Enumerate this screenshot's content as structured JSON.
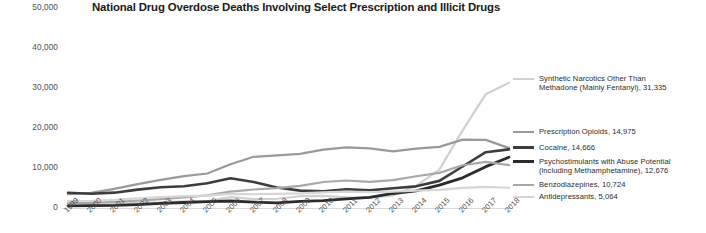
{
  "chart_data": {
    "type": "line",
    "title": "National Drug Overdose Deaths Involving Select Prescription and Illicit Drugs",
    "xlabel": "",
    "ylabel": "",
    "x": [
      1999,
      2000,
      2001,
      2002,
      2003,
      2004,
      2005,
      2006,
      2007,
      2008,
      2009,
      2010,
      2011,
      2012,
      2013,
      2014,
      2015,
      2016,
      2017,
      2018
    ],
    "xtick_labels": [
      "1999",
      "2000",
      "2001",
      "2002",
      "2003",
      "2004",
      "2005",
      "2006",
      "2007",
      "2008",
      "2009",
      "2010",
      "2011",
      "2012",
      "2013",
      "2014",
      "2015",
      "2016",
      "2017",
      "2018"
    ],
    "ylim": [
      0,
      50000
    ],
    "ytick_values": [
      0,
      10000,
      20000,
      30000,
      40000,
      50000
    ],
    "ytick_labels": [
      "0",
      "10,000",
      "20,000",
      "30,000",
      "40,000",
      "50,000"
    ],
    "grid": false,
    "legend_position": "right",
    "series": [
      {
        "name": "Synthetic Narcotics Other Than Methadone (Mainly Fentanyl)",
        "legend_label": "Synthetic Narcotics Other Than\nMethadone (Mainly Fentanyl), 31,335",
        "final_value": "31,335",
        "color": "#d0d0d0",
        "width": 2.2,
        "values": [
          730,
          782,
          957,
          1295,
          1400,
          1664,
          1742,
          2707,
          2213,
          2306,
          2946,
          3007,
          2666,
          2628,
          3105,
          5544,
          9580,
          19413,
          28466,
          31335
        ]
      },
      {
        "name": "Prescription Opioids",
        "legend_label": "Prescription Opioids, 14,975",
        "final_value": "14,975",
        "color": "#9a9a9a",
        "width": 2.2,
        "values": [
          3442,
          3785,
          4770,
          5951,
          7028,
          7973,
          8630,
          10940,
          12796,
          13149,
          13523,
          14583,
          15140,
          14919,
          14145,
          14838,
          15281,
          17087,
          17029,
          14975
        ]
      },
      {
        "name": "Cocaine",
        "legend_label": "Cocaine, 14,666",
        "final_value": "14,666",
        "color": "#3d3d3d",
        "width": 2.6,
        "values": [
          3822,
          3544,
          3833,
          4599,
          5196,
          5443,
          6208,
          7448,
          6512,
          5129,
          4350,
          4183,
          4681,
          4404,
          4944,
          5415,
          6784,
          10375,
          13942,
          14666
        ]
      },
      {
        "name": "Psychostimulants with Abuse Potential (including Methamphetamine)",
        "legend_label": "Psychostimulants with Abuse Potential\n(including Methamphetamine), 12,676",
        "final_value": "12,676",
        "color": "#2b2b2b",
        "width": 2.8,
        "values": [
          547,
          573,
          645,
          859,
          1179,
          1371,
          1608,
          1744,
          1482,
          1304,
          1632,
          1854,
          2266,
          2635,
          3627,
          4298,
          5716,
          7542,
          10333,
          12676
        ]
      },
      {
        "name": "Benzodiazepines",
        "legend_label": "Benzodiazepines, 10,724",
        "final_value": "10,724",
        "color": "#a8a8a8",
        "width": 2.2,
        "values": [
          1135,
          1298,
          1519,
          1836,
          2209,
          2663,
          3153,
          4107,
          4620,
          4977,
          5525,
          6497,
          6872,
          6524,
          6973,
          7945,
          8791,
          10684,
          11537,
          10724
        ]
      },
      {
        "name": "Antidepressants",
        "legend_label": "Antidepressants, 5,064",
        "final_value": "5,064",
        "color": "#d6d6d6",
        "width": 2.2,
        "values": [
          1749,
          1814,
          2030,
          2384,
          2695,
          2984,
          3112,
          3529,
          3490,
          3548,
          3639,
          3889,
          4072,
          3961,
          4117,
          4328,
          4548,
          5017,
          5269,
          5064
        ]
      }
    ]
  },
  "legend": {
    "entries": [
      {
        "label": "Synthetic Narcotics Other Than\nMethadone (Mainly Fentanyl), 31,335",
        "color": "#d0d0d0",
        "name": "legend-fentanyl"
      },
      {
        "label": "Prescription Opioids, 14,975",
        "color": "#9a9a9a",
        "name": "legend-prescription-opioids"
      },
      {
        "label": "Cocaine, 14,666",
        "color": "#3d3d3d",
        "name": "legend-cocaine"
      },
      {
        "label": "Psychostimulants with Abuse Potential\n(including Methamphetamine), 12,676",
        "color": "#2b2b2b",
        "name": "legend-psychostimulants"
      },
      {
        "label": "Benzodiazepines, 10,724",
        "color": "#a8a8a8",
        "name": "legend-benzodiazepines"
      },
      {
        "label": "Antidepressants, 5,064",
        "color": "#d6d6d6",
        "name": "legend-antidepressants"
      }
    ]
  }
}
